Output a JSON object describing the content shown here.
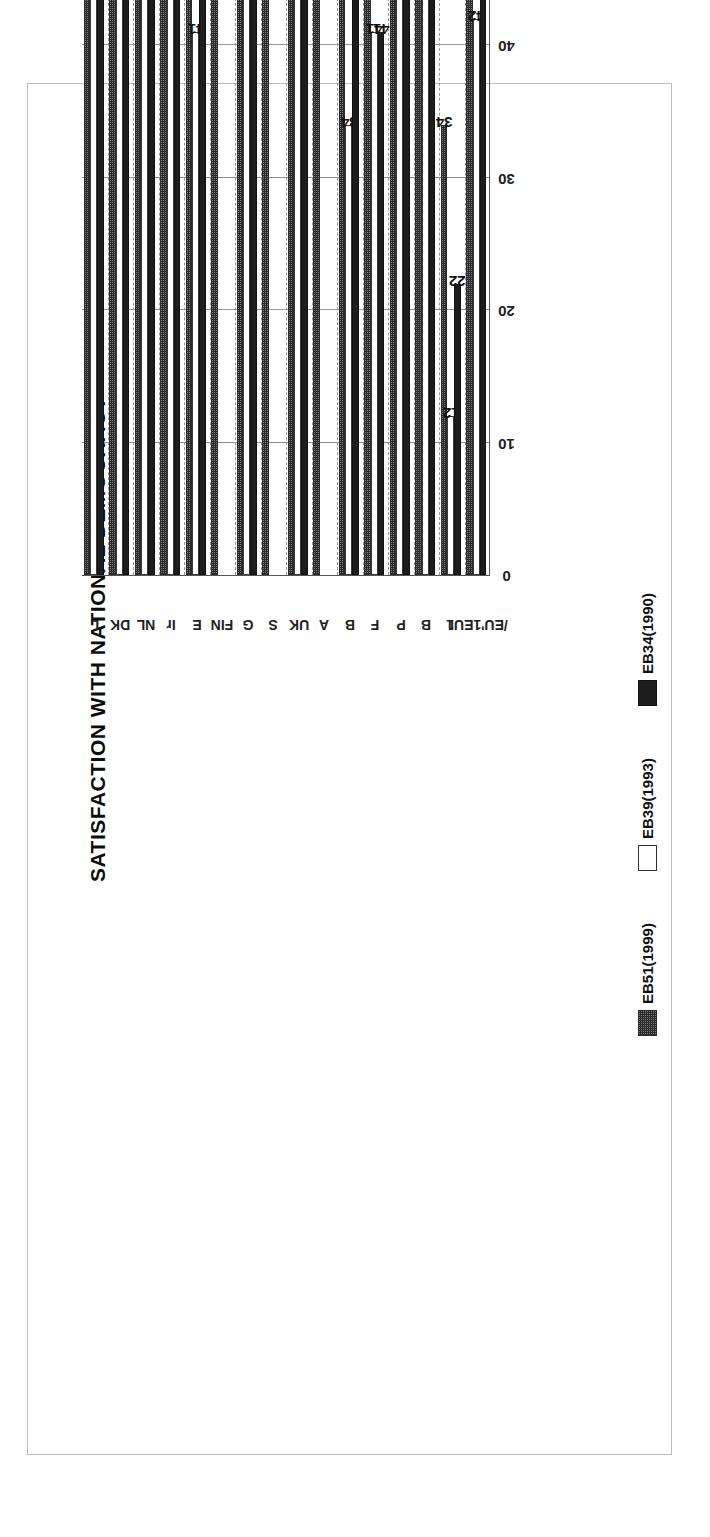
{
  "chart_data": {
    "type": "bar",
    "orientation": "horizontal-rotated-90ccw",
    "title": "SATISFACTION WITH NATIONAL DEMOCRACY",
    "xlabel": "",
    "ylabel": "",
    "ylim": [
      0,
      90
    ],
    "ticks": [
      "0",
      "10",
      "20",
      "30",
      "40",
      "50",
      "60",
      "70",
      "80",
      "90"
    ],
    "grid": true,
    "legend_position": "bottom",
    "categories": [
      "L",
      "DK",
      "NL",
      "Ir",
      "E",
      "FIN",
      "G",
      "S",
      "UK",
      "A",
      "B",
      "F",
      "P",
      "B",
      "I",
      "/EU'1EU1"
    ],
    "series": [
      {
        "name": "EB34(1990)",
        "fill": "solid-black",
        "color": "#1d1d1d",
        "values": [
          72,
          70,
          67,
          59,
          57,
          null,
          74,
          null,
          50,
          null,
          44,
          41,
          71,
          56,
          22,
          52
        ]
      },
      {
        "name": "EB39(1993)",
        "fill": "white",
        "color": "#ffffff",
        "values": [
          72,
          81,
          68,
          62,
          41,
          null,
          51,
          null,
          49,
          null,
          34,
          41,
          54,
          49,
          12,
          42
        ]
      },
      {
        "name": "EB51(1999)",
        "fill": "dotted-gray",
        "color": "#7e7e7e",
        "values": [
          83,
          81,
          78,
          74,
          71,
          67,
          66,
          65,
          64,
          64,
          62,
          59,
          57,
          49,
          34,
          60
        ]
      }
    ],
    "data_labels": {
      "L": {
        "EB34(1990)": "72",
        "EB39(1993)": "72",
        "EB51(1999)": "83"
      },
      "DK": {
        "EB34(1990)": "70",
        "EB39(1993)": "81",
        "EB51(1999)": "81"
      },
      "NL": {
        "EB34(1990)": "67",
        "EB39(1993)": "68",
        "EB51(1999)": "78"
      },
      "Ir": {
        "EB34(1990)": "59",
        "EB39(1993)": "62",
        "EB51(1999)": "74"
      },
      "E": {
        "EB34(1990)": "57",
        "EB39(1993)": "41",
        "EB51(1999)": "71"
      },
      "FIN": {
        "EB34(1990)": "",
        "EB39(1993)": "",
        "EB51(1999)": "67"
      },
      "G": {
        "EB34(1990)": "74",
        "EB39(1993)": "51",
        "EB51(1999)": "66"
      },
      "S": {
        "EB34(1990)": "",
        "EB39(1993)": "",
        "EB51(1999)": "65"
      },
      "UK": {
        "EB34(1990)": "50",
        "EB39(1993)": "49",
        "EB51(1999)": "64"
      },
      "A": {
        "EB34(1990)": "",
        "EB39(1993)": "",
        "EB51(1999)": "64"
      },
      "B": {
        "EB34(1990)": "44",
        "EB39(1993)": "34",
        "EB51(1999)": "62"
      },
      "F": {
        "EB34(1990)": "41",
        "EB39(1993)": "41",
        "EB51(1999)": "59"
      },
      "P": {
        "EB34(1990)": "71",
        "EB39(1993)": "54",
        "EB51(1999)": "57"
      },
      "B2": {
        "EB34(1990)": "56",
        "EB39(1993)": "49",
        "EB51(1999)": "49"
      },
      "I": {
        "EB34(1990)": "22",
        "EB39(1993)": "12",
        "EB51(1999)": "34"
      },
      "/EU'1EU1": {
        "EB34(1990)": "52",
        "EB39(1993)": "42",
        "EB51(1999)": "60"
      }
    }
  },
  "legend": {
    "items": [
      {
        "label": "EB34(1990)",
        "style": "solid-black"
      },
      {
        "label": "EB39(1993)",
        "style": "white"
      },
      {
        "label": "EB51(1999)",
        "style": "dotted-gray"
      }
    ]
  },
  "colors": {
    "eb34": "#1d1d1d",
    "eb39": "#ffffff",
    "eb51": "#7e7e7e",
    "axis": "#555555",
    "grid": "#9a9a9a",
    "frame": "#bdbdbd",
    "text": "#111111",
    "background": "#ffffff"
  }
}
